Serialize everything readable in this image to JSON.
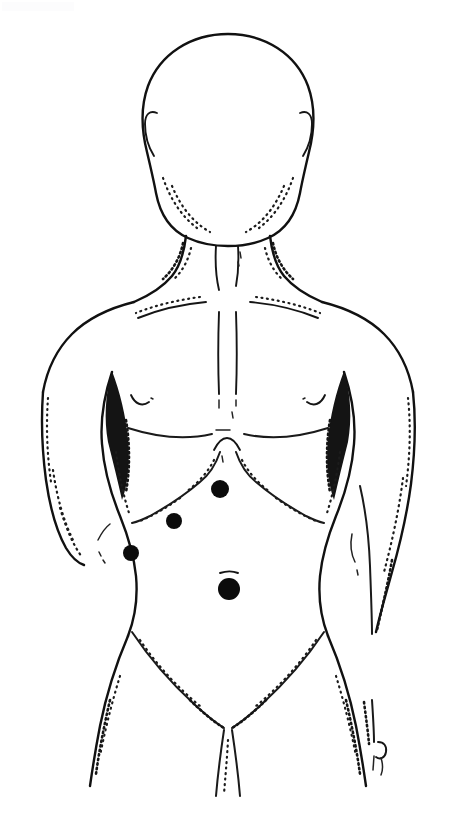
{
  "figure": {
    "title": "Anterior human torso body diagram",
    "description": "Line drawing of a front-facing human head, neck, torso, arms and upper thighs with four solid black markers placed on the abdomen.",
    "view": "anterior",
    "canvas_width": 456,
    "canvas_height": 832,
    "background_color": "#ffffff",
    "ink_color": "#111111"
  },
  "body_parts": [
    {
      "name": "head",
      "label": "Head"
    },
    {
      "name": "left-ear",
      "label": "Ear (figure left)"
    },
    {
      "name": "right-ear",
      "label": "Ear (figure right)"
    },
    {
      "name": "neck",
      "label": "Neck"
    },
    {
      "name": "sternocleidomastoid",
      "label": "Neck tendons"
    },
    {
      "name": "clavicle-left",
      "label": "Clavicle (figure left)"
    },
    {
      "name": "clavicle-right",
      "label": "Clavicle (figure right)"
    },
    {
      "name": "sternum",
      "label": "Sternum line"
    },
    {
      "name": "shoulder-left",
      "label": "Shoulder (figure left)"
    },
    {
      "name": "shoulder-right",
      "label": "Shoulder (figure right)"
    },
    {
      "name": "arm-left",
      "label": "Arm (figure left)"
    },
    {
      "name": "arm-right",
      "label": "Arm (figure right)"
    },
    {
      "name": "hand-right",
      "label": "Hand (figure right)"
    },
    {
      "name": "chest",
      "label": "Chest"
    },
    {
      "name": "nipple-left",
      "label": "Nipple (figure left)"
    },
    {
      "name": "nipple-right",
      "label": "Nipple (figure right)"
    },
    {
      "name": "ribcage",
      "label": "Costal margin"
    },
    {
      "name": "abdomen",
      "label": "Abdomen"
    },
    {
      "name": "navel",
      "label": "Navel"
    },
    {
      "name": "waist",
      "label": "Waist"
    },
    {
      "name": "inguinal-crease",
      "label": "Inguinal crease"
    },
    {
      "name": "groin",
      "label": "Groin"
    },
    {
      "name": "thigh-left",
      "label": "Thigh (figure left)"
    },
    {
      "name": "thigh-right",
      "label": "Thigh (figure right)"
    }
  ],
  "markers": {
    "count": 4,
    "color": "#0b0b0b",
    "shape": "filled-circle",
    "items": [
      {
        "id": "marker-1",
        "label": "Marker 1",
        "region": "epigastric",
        "cx": 220,
        "cy": 489,
        "r": 9
      },
      {
        "id": "marker-2",
        "label": "Marker 2",
        "region": "left upper quadrant",
        "cx": 174,
        "cy": 521,
        "r": 8
      },
      {
        "id": "marker-3",
        "label": "Marker 3",
        "region": "left flank",
        "cx": 131,
        "cy": 553,
        "r": 8
      },
      {
        "id": "marker-4",
        "label": "Marker 4",
        "region": "umbilical",
        "cx": 229,
        "cy": 589,
        "r": 11
      }
    ]
  }
}
